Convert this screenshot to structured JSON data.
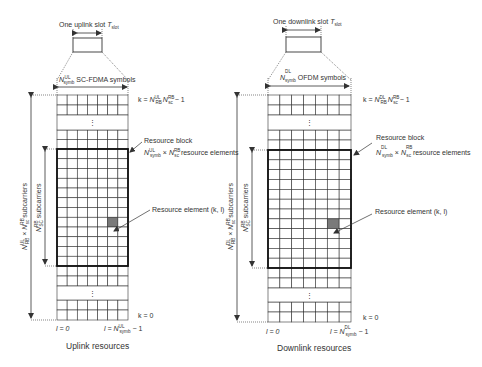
{
  "uplink": {
    "slot_label": "One uplink slot ",
    "slot_T": "T",
    "slot_sub": "slot",
    "symbols_N": "N",
    "symbols_sup": "UL",
    "symbols_sub": "symb",
    "symbols_text": " SC-FDMA symbols",
    "k_top": {
      "prefix": "k = ",
      "N1": "N",
      "N1_sup": "UL",
      "N1_sub": "RB",
      "N2": "N",
      "N2_sup": "RB",
      "N2_sub": "sc",
      "suffix": " − 1"
    },
    "resource_block_title": "Resource block",
    "resource_block_formula": {
      "N1": "N",
      "N1_sup": "UL",
      "N1_sub": "symb",
      "times": " × ",
      "N2": "N",
      "N2_sup": "RB",
      "N2_sub": "sc",
      "suffix": " resource elements"
    },
    "resource_element": "Resource element (k, l)",
    "outer_label": {
      "N1": "N",
      "N1_sup": "UL",
      "N1_sub": "RB",
      "times": " × ",
      "N2": "N",
      "N2_sup": "RB",
      "N2_sub": "sc",
      "suffix": " subcarriers"
    },
    "inner_label": {
      "N": "N",
      "sup": "RB",
      "sub": "SC",
      "suffix": " subcarriers"
    },
    "k_bottom": "k = 0",
    "l_start": "l = 0",
    "l_end": {
      "prefix": "l = ",
      "N": "N",
      "sup": "UL",
      "sub": "symb",
      "suffix": " − 1"
    },
    "caption": "Uplink resources"
  },
  "downlink": {
    "slot_label": "One downlink slot ",
    "slot_T": "T",
    "slot_sub": "slot",
    "symbols_N": "N",
    "symbols_sup": "DL",
    "symbols_sub": "symb",
    "symbols_text": " OFDM symbols",
    "k_top": {
      "prefix": "k = ",
      "N1": "N",
      "N1_sup": "DL",
      "N1_sub": "RB",
      "N2": "N",
      "N2_sup": "RB",
      "N2_sub": "sc",
      "suffix": " − 1"
    },
    "resource_block_title": "Resource block",
    "resource_block_formula": {
      "N1": "N",
      "N1_sup": "DL",
      "N1_sub": "symb",
      "times": " × ",
      "N2": "N",
      "N2_sup": "RB",
      "N2_sub": "sc",
      "suffix": " resource elements"
    },
    "resource_element": "Resource element (k, l)",
    "outer_label": {
      "N1": "N",
      "N1_sup": "DL",
      "N1_sub": "RB",
      "times": " × ",
      "N2": "N",
      "N2_sup": "RB",
      "N2_sub": "sc",
      "suffix": " subcarriers"
    },
    "inner_label": {
      "N": "N",
      "sup": "RB",
      "sub": "SC",
      "suffix": " subcarriers"
    },
    "k_bottom": "k = 0",
    "l_start": "l = 0",
    "l_end": {
      "prefix": "l = ",
      "N": "N",
      "sup": "DL",
      "sub": "symb",
      "suffix": " − 1"
    },
    "caption": "Downlink resources"
  },
  "ellipsis": "⋮",
  "colors": {
    "line": "#333333",
    "highlight": "#7a7a7a",
    "block_border": "#111111"
  }
}
